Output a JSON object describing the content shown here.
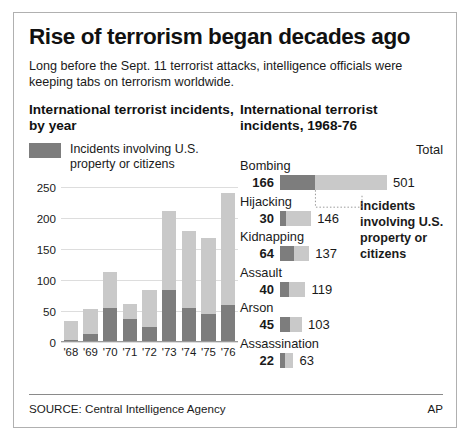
{
  "headline": "Rise of terrorism began decades ago",
  "deck": "Long before the Sept. 11 terrorist attacks, intelligence officials were keeping tabs on terrorism worldwide.",
  "colors": {
    "us_involved": "#7d7d7d",
    "total": "#c9c9c9",
    "border": "#b0b0b0",
    "gridline": "#dddddd"
  },
  "left_panel": {
    "title": "International terrorist incidents, by year",
    "legend_label": "Incidents involving U.S. property or citizens"
  },
  "right_panel": {
    "title": "International terrorist incidents, 1968-76",
    "total_header": "Total",
    "callout": "Incidents involving U.S. property or citizens"
  },
  "footer": {
    "source": "SOURCE: Central Intelligence Agency",
    "credit": "AP"
  },
  "chart_data": [
    {
      "type": "bar",
      "title": "International terrorist incidents, by year",
      "subtype": "stacked-vertical",
      "xlabel": "",
      "ylabel": "",
      "ylim": [
        0,
        250
      ],
      "yticks": [
        0,
        50,
        100,
        150,
        200,
        250
      ],
      "grid": true,
      "legend": [
        "Incidents involving U.S. property or citizens"
      ],
      "categories": [
        "'68",
        "'69",
        "'70",
        "'71",
        "'72",
        "'73",
        "'74",
        "'75",
        "'76"
      ],
      "series": [
        {
          "name": "Incidents involving U.S. property or citizens",
          "values": [
            3,
            13,
            54,
            36,
            23,
            83,
            55,
            45,
            59
          ]
        },
        {
          "name": "Total incidents",
          "values": [
            34,
            52,
            112,
            60,
            84,
            211,
            178,
            167,
            240
          ]
        }
      ]
    },
    {
      "type": "bar",
      "title": "International terrorist incidents, 1968-76",
      "subtype": "stacked-horizontal",
      "xlabel": "",
      "ylabel": "",
      "total_header": "Total",
      "annotation": "Incidents involving U.S. property or citizens",
      "categories": [
        "Bombing",
        "Hijacking",
        "Kidnapping",
        "Assault",
        "Arson",
        "Assassination"
      ],
      "series": [
        {
          "name": "Incidents involving U.S. property or citizens",
          "values": [
            166,
            30,
            64,
            40,
            45,
            22
          ]
        },
        {
          "name": "Total",
          "values": [
            501,
            146,
            137,
            119,
            103,
            63
          ]
        }
      ]
    }
  ]
}
